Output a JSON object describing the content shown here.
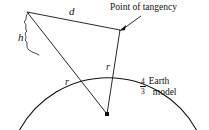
{
  "figure": {
    "background_color": "#ffffff",
    "line_color": "#111111",
    "labels": {
      "distance": "d",
      "height": "h",
      "radius_left": "r",
      "radius_right": "r",
      "tangency": "Point of tangency",
      "earth_model_numerator": "4",
      "earth_model_denominator": "3",
      "earth_model_word1": "Earth",
      "earth_model_word2": "model"
    },
    "geometry": {
      "antenna_top": [
        27,
        12
      ],
      "tangency_point": [
        119,
        29
      ],
      "earth_center": [
        107,
        114
      ],
      "arc_left_end": [
        19,
        130
      ],
      "arc_right_end": [
        197,
        130
      ],
      "surface_intersection": [
        53,
        56
      ],
      "arrow_tail": [
        141,
        16
      ],
      "arrow_head": [
        122,
        30
      ]
    }
  }
}
